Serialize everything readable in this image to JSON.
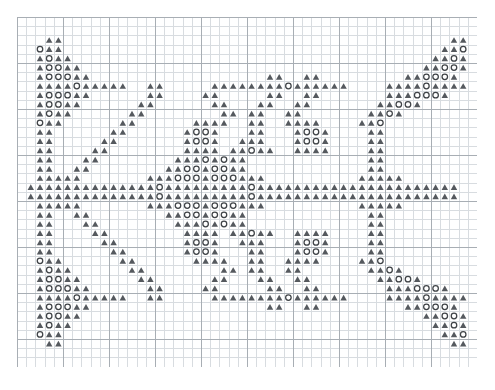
{
  "chart_data": {
    "type": "heatmap",
    "title": "",
    "subtitle": "",
    "xlabel": "",
    "ylabel": "",
    "grid": {
      "columns": 50,
      "rows": 38,
      "cell_px": 9.2,
      "minor_line_color": "#d8dce0",
      "major_line_color": "#a8aeb4",
      "major_every": 5,
      "grid_on": true,
      "background": "#ffffff"
    },
    "legend": [],
    "legend_position": "none",
    "symbols": {
      "triangle": {
        "code": "T",
        "name": "filled-triangle",
        "color": "#55595e",
        "shape": "triangle-filled"
      },
      "circle": {
        "code": "O",
        "name": "open-circle",
        "color": "#3f4347",
        "shape": "circle-outline"
      },
      "empty": {
        "code": ".",
        "name": "empty-cell",
        "color": "none",
        "shape": "none"
      }
    },
    "rows": [
      "..................................................",
      "..................................................",
      "...TT..........................................TT.",
      "..OTT.........................................TTO.",
      "..TOTT.......................................TTOT.",
      "..TOOTT.....................................TTOOT.",
      "..TOOOTT...................TT..TT.........TTOOOT.",
      "..TTTTOTTTTT..TT.....TTTTTTTTOTTTTTT....TTTTOTTTT.",
      "..TOOOTT......TT....TT.....TT..TT.......TTTOOOT...",
      "..TOOTT......TT......TT...TT..TT.......TTOOT......",
      "..TOTT......TT........TT.TT..TT.......TTOT........",
      "..OTT......TT......TTTT..TT..TTTT....TTO..........",
      "..TT......TT......TOOT...TT...TOOT....TT..........",
      "..TT.....TT.......TOOT..TTT...TOOT....TT..........",
      "..TT....TT........TTTT.TTOTT..TTTT....TT..........",
      "..TT...TT........TTTOTOTT.............TT..........",
      "..TT..TT........TTOOTOOTT.............TT..........",
      "..TTTTT.......TTTOOOTOOOTTT..........TTTTT........",
      ".TTTTTTTTTTTTTTOTTTTTTTTTOTTTTTTTTTTTTTTTTTTTTTT.",
      ".TTTTTTTTTTTTTTOTTTTTTTTTOTTTTTTTTTTTTTTTTTTTTTT.",
      "..TTTTT.......TTTOOOTOOOTTT..........TTTTT........",
      "..TT..TT........TTOOTOOTT.............TT..........",
      "..TT...TT........TTTOTOTT.............TT..........",
      "..TT....TT........TTTT.TTOTT..TTTT....TT..........",
      "..TT.....TT.......TOOT..TTT...TOOT....TT..........",
      "..TT......TT......TOOT...TT...TOOT....TT..........",
      "..OTT......TT......TTTT..TT..TTTT....TTO..........",
      "..TOTT......TT........TT.TT..TT.......TTOT........",
      "..TOOTT......TT......TT...TT..TT.......TTOOT......",
      "..TOOOTT......TT....TT.....TT..TT.......TTTOOOT...",
      "..TTTTOTTTTT..TT.....TTTTTTTTOTTTTTT....TTTTOTTTT.",
      "..TOOOTT...................TT..TT.........TTOOOT.",
      "..TOOTT.....................................TTOOT.",
      "..TOTT.......................................TTOT.",
      "..OTT.........................................TTO.",
      "...TT..........................................TT.",
      "..................................................",
      ".................................................."
    ]
  },
  "meta": {
    "page_background": "#ffffff",
    "chart_origin_x": 17,
    "chart_origin_y": 17
  }
}
